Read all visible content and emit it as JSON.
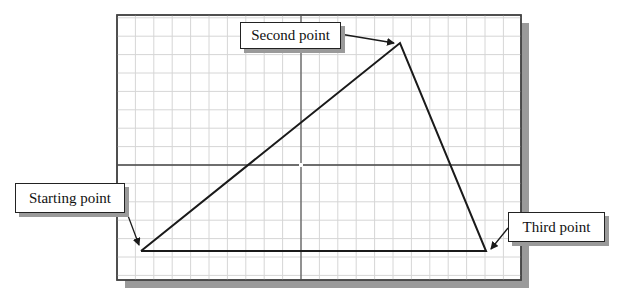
{
  "diagram": {
    "type": "grid-triangle-construction",
    "labels": {
      "starting_point": "Starting point",
      "second_point": "Second point",
      "third_point": "Third point"
    },
    "points": {
      "starting": {
        "x": 141,
        "y": 251
      },
      "second": {
        "x": 400,
        "y": 43
      },
      "third": {
        "x": 486,
        "y": 251
      }
    },
    "frame": {
      "x": 117,
      "y": 15,
      "width": 404,
      "height": 265
    },
    "axes": {
      "vertical_x": 301,
      "horizontal_y": 165
    },
    "grid_spacing": 18.4,
    "colors": {
      "grid": "#d6d6d6",
      "frame": "#444444",
      "shadow": "#9a9a9a",
      "line": "#1a1a1a"
    }
  }
}
